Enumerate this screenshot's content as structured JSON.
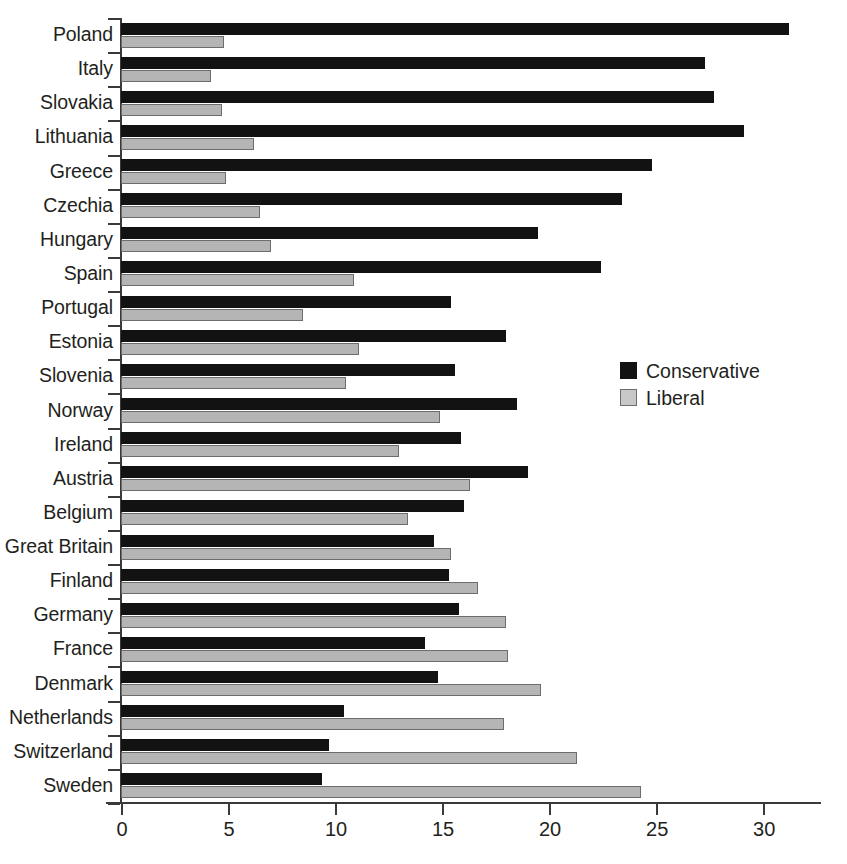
{
  "chart_data": {
    "type": "bar",
    "orientation": "horizontal",
    "title": "",
    "xlabel": "",
    "ylabel": "",
    "xlim": [
      0,
      32.7
    ],
    "xticks": [
      0,
      5,
      10,
      15,
      20,
      25,
      30
    ],
    "xtick_labels": [
      "0",
      "5",
      "10",
      "15",
      "20",
      "25",
      "30"
    ],
    "grid": false,
    "legend_position": "center-right",
    "categories": [
      "Poland",
      "Italy",
      "Slovakia",
      "Lithuania",
      "Greece",
      "Czechia",
      "Hungary",
      "Spain",
      "Portugal",
      "Estonia",
      "Slovenia",
      "Norway",
      "Ireland",
      "Austria",
      "Belgium",
      "Great Britain",
      "Finland",
      "Germany",
      "France",
      "Denmark",
      "Netherlands",
      "Switzerland",
      "Sweden"
    ],
    "series": [
      {
        "name": "Conservative",
        "color": "#121212",
        "values": [
          31.2,
          27.3,
          27.7,
          29.1,
          24.8,
          23.4,
          19.5,
          22.4,
          15.4,
          18.0,
          15.6,
          18.5,
          15.9,
          19.0,
          16.0,
          14.6,
          15.3,
          15.8,
          14.2,
          14.8,
          10.4,
          9.7,
          9.4
        ]
      },
      {
        "name": "Liberal",
        "color": "#b5b5b5",
        "values": [
          4.8,
          4.2,
          4.7,
          6.2,
          4.9,
          6.5,
          7.0,
          10.9,
          8.5,
          11.1,
          10.5,
          14.9,
          13.0,
          16.3,
          13.4,
          15.4,
          16.7,
          18.0,
          18.1,
          19.6,
          17.9,
          21.3,
          24.3
        ]
      }
    ]
  },
  "legend": {
    "items": [
      {
        "label": "Conservative",
        "swatch": "conservative"
      },
      {
        "label": "Liberal",
        "swatch": "liberal"
      }
    ]
  },
  "caption": ""
}
